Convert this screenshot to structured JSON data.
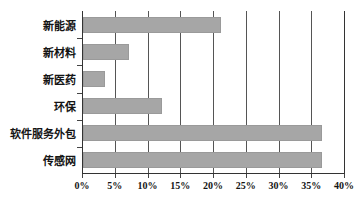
{
  "chart_data": {
    "type": "bar",
    "orientation": "horizontal",
    "title": "",
    "xlabel": "",
    "ylabel": "",
    "categories": [
      "新能源",
      "新材料",
      "新医药",
      "环保",
      "软件服务外包",
      "传感网"
    ],
    "values": [
      21,
      7,
      3.3,
      12,
      36.5,
      36.5
    ],
    "value_suffix": "%",
    "xlim": [
      0,
      40
    ],
    "xticks": [
      0,
      5,
      10,
      15,
      20,
      25,
      30,
      35,
      40
    ],
    "xtick_labels": [
      "0%",
      "5%",
      "10%",
      "15%",
      "20%",
      "25%",
      "30%",
      "35%",
      "40%"
    ],
    "grid": true,
    "grid_axis": "x",
    "legend": false,
    "series": [
      {
        "name": "占比",
        "values": [
          21,
          7,
          3.3,
          12,
          36.5,
          36.5
        ]
      }
    ]
  },
  "style": {
    "bar_color": "#a6a6a6",
    "grid_color": "#555555",
    "axis_color": "#333333",
    "background": "#ffffff",
    "text_color": "#141414"
  }
}
